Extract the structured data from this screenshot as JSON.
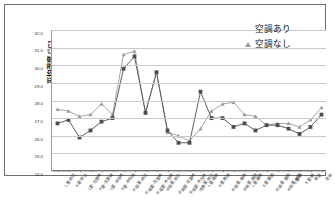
{
  "chart_data": {
    "type": "line",
    "title": "",
    "xlabel": "",
    "ylabel": "平均温度 [°C]",
    "ylim": [
      24.0,
      32.0
    ],
    "ytick_labels": [
      "32.0",
      "31.0",
      "30.0",
      "29.0",
      "28.0",
      "27.0",
      "26.0",
      "25.0",
      "24.0"
    ],
    "ytick_values": [
      32.0,
      31.0,
      30.0,
      29.0,
      28.0,
      27.0,
      26.0,
      25.0,
      24.0
    ],
    "grid": true,
    "legend_position": "top-right",
    "categories": [
      "L室-終日",
      "K室-終日",
      "L室-在室時",
      "K室-在室時",
      "L室-不在時",
      "K室-不在時",
      "R.寝室-終日",
      "R.寝室-在室時",
      "R.寝室-不在時",
      "子供室-終日",
      "子供室-在室時",
      "子供室-不在時",
      "洗面室-終日",
      "L室-夜間",
      "K室-夜間",
      "R.寝室-夜間",
      "子供室-夜間",
      "L室-昼間",
      "K室-昼間",
      "R.寝室-昼間",
      "子供室-昼間",
      "L室-朝",
      "K室-朝",
      "寝室",
      "全体"
    ],
    "series": [
      {
        "name": "空調あり",
        "marker": "triangle",
        "color": "#9b9b9b",
        "values": [
          27.5,
          27.4,
          27.1,
          27.2,
          27.8,
          27.2,
          30.6,
          30.8,
          27.3,
          29.6,
          26.2,
          26.0,
          25.7,
          26.4,
          27.4,
          27.8,
          27.9,
          27.2,
          27.1,
          26.6,
          26.7,
          26.7,
          26.5,
          26.9,
          27.6
        ]
      },
      {
        "name": "空調なし",
        "marker": "square",
        "color": "#4d4d4d",
        "values": [
          26.7,
          26.9,
          25.9,
          26.3,
          26.8,
          27.0,
          29.8,
          30.5,
          27.3,
          29.6,
          26.3,
          25.6,
          25.6,
          28.5,
          27.0,
          27.0,
          26.5,
          26.7,
          26.3,
          26.6,
          26.6,
          26.4,
          26.1,
          26.5,
          27.2
        ]
      }
    ]
  },
  "legend": {
    "items": [
      {
        "label": "空調あり",
        "marker": "triangle"
      },
      {
        "label": "空調なし",
        "marker": "square"
      }
    ]
  },
  "axis": {
    "y_title": "平均温度 [°C]"
  }
}
